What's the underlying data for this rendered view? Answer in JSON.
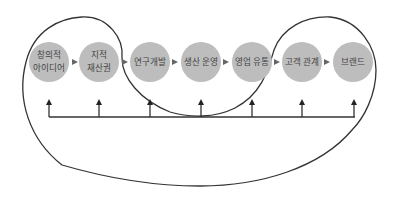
{
  "diagram": {
    "type": "value-chain-loop",
    "colors": {
      "node_fill": "#bdbdbd",
      "line": "#333333",
      "text": "#444444",
      "background": "#ffffff"
    },
    "nodes": [
      {
        "id": "n1",
        "lines": [
          "창의적",
          "아이디어"
        ]
      },
      {
        "id": "n2",
        "lines": [
          "지적",
          "재산권"
        ]
      },
      {
        "id": "n3",
        "lines": [
          "연구개발"
        ]
      },
      {
        "id": "n4",
        "lines": [
          "생산 운영"
        ]
      },
      {
        "id": "n5",
        "lines": [
          "영업 유통"
        ]
      },
      {
        "id": "n6",
        "lines": [
          "고객 관계"
        ]
      },
      {
        "id": "n7",
        "lines": [
          "브랜드"
        ]
      }
    ],
    "edges": [
      {
        "from": "n1",
        "to": "n2"
      },
      {
        "from": "n2",
        "to": "n3"
      },
      {
        "from": "n3",
        "to": "n4"
      },
      {
        "from": "n4",
        "to": "n5"
      },
      {
        "from": "n5",
        "to": "n6"
      },
      {
        "from": "n6",
        "to": "n7"
      }
    ],
    "feedback_bar": {
      "description": "horizontal bar with upward arrows feeding each node",
      "arrow_count": 7
    },
    "loop_curve": {
      "description": "closed looping curve weaving around the nodes in a figure-eight-like path"
    }
  }
}
